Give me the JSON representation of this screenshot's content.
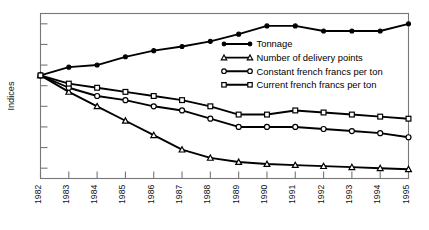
{
  "chart_data": {
    "type": "line",
    "title": "",
    "xlabel": "",
    "ylabel": "Indices",
    "grid": false,
    "legend_position": "inside-right-upper",
    "x": [
      "1982",
      "1983",
      "1984",
      "1985",
      "1986",
      "1987",
      "1988",
      "1989",
      "1990",
      "1991",
      "1992",
      "1993",
      "1994",
      "1995"
    ],
    "categories": [
      "1982",
      "1983",
      "1984",
      "1985",
      "1986",
      "1987",
      "1988",
      "1989",
      "1990",
      "1991",
      "1992",
      "1993",
      "1994",
      "1995"
    ],
    "ylim": [
      0,
      160
    ],
    "yticks_labeled": false,
    "ytick_count": 8,
    "series": [
      {
        "name": "Tonnage",
        "marker": "filled-circle",
        "values": [
          100,
          108,
          110,
          118,
          124,
          128,
          133,
          140,
          148,
          148,
          143,
          143,
          143,
          150
        ]
      },
      {
        "name": "Number of delivery points",
        "marker": "open-triangle",
        "values": [
          100,
          84,
          70,
          56,
          42,
          28,
          20,
          16,
          14,
          13,
          12,
          11,
          10,
          9
        ]
      },
      {
        "name": "Constant french francs per ton",
        "marker": "open-circle",
        "values": [
          100,
          88,
          80,
          76,
          70,
          66,
          58,
          50,
          50,
          50,
          48,
          46,
          44,
          40
        ]
      },
      {
        "name": "Current french francs per ton",
        "marker": "open-square",
        "values": [
          100,
          92,
          88,
          84,
          80,
          76,
          70,
          62,
          62,
          66,
          64,
          62,
          60,
          58
        ]
      }
    ]
  },
  "legend": {
    "entries": [
      {
        "label": "Tonnage",
        "marker": "filled-circle"
      },
      {
        "label": "Number of delivery points",
        "marker": "open-triangle"
      },
      {
        "label": "Constant french francs per ton",
        "marker": "open-circle"
      },
      {
        "label": "Current french francs per ton",
        "marker": "open-square"
      }
    ]
  },
  "axes": {
    "y_axis_title": "Indices"
  },
  "colors": {
    "line": "#000000",
    "frame": "#777777",
    "marker_fill": "#ffffff",
    "background": "#ffffff"
  }
}
